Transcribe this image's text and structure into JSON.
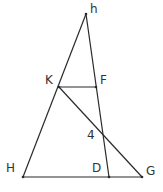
{
  "diagram": {
    "points": {
      "h": {
        "label": "h",
        "x": 86,
        "y": 14,
        "lx": 90,
        "ly": 13
      },
      "K": {
        "label": "K",
        "x": 59,
        "y": 87,
        "lx": 45,
        "ly": 84
      },
      "F": {
        "label": "F",
        "x": 96,
        "y": 87,
        "lx": 100,
        "ly": 84
      },
      "H": {
        "label": "H",
        "x": 23,
        "y": 177,
        "lx": 6,
        "ly": 172
      },
      "D": {
        "label": "D",
        "x": 109,
        "y": 177,
        "lx": 92,
        "ly": 172
      },
      "G": {
        "label": "G",
        "x": 142,
        "y": 177,
        "lx": 146,
        "ly": 175
      },
      "X": {
        "label": "4",
        "x": 102,
        "y": 134,
        "lx": 87,
        "ly": 139
      }
    },
    "segments": [
      [
        "h",
        "H"
      ],
      [
        "h",
        "D"
      ],
      [
        "H",
        "G"
      ],
      [
        "K",
        "F"
      ],
      [
        "K",
        "G"
      ]
    ]
  }
}
